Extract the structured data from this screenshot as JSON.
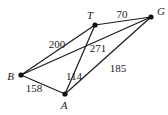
{
  "graph": {
    "nodes": [
      {
        "id": "T",
        "label": "T"
      },
      {
        "id": "G",
        "label": "G"
      },
      {
        "id": "B",
        "label": "B"
      },
      {
        "id": "A",
        "label": "A"
      }
    ],
    "edges": [
      {
        "from": "T",
        "to": "G",
        "weight": "70"
      },
      {
        "from": "B",
        "to": "T",
        "weight": "200"
      },
      {
        "from": "B",
        "to": "G",
        "weight": "271"
      },
      {
        "from": "A",
        "to": "T",
        "weight": "114"
      },
      {
        "from": "A",
        "to": "G",
        "weight": "185"
      },
      {
        "from": "B",
        "to": "A",
        "weight": "158"
      }
    ]
  }
}
